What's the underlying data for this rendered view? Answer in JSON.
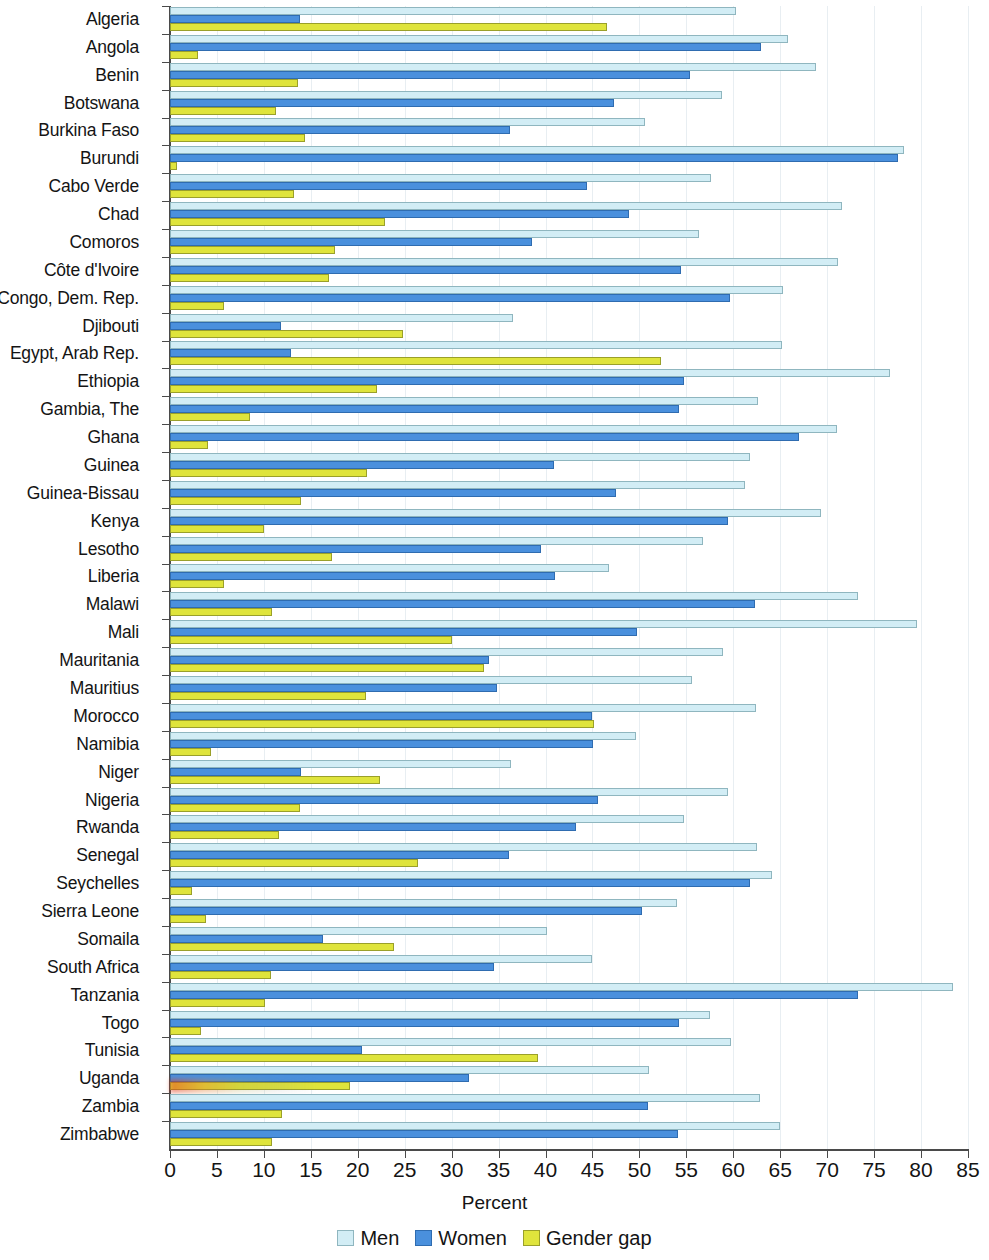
{
  "chart_data": {
    "type": "bar",
    "orientation": "horizontal",
    "title": "",
    "xlabel": "Percent",
    "ylabel": "",
    "xlim": [
      0,
      85
    ],
    "xticks": [
      0,
      5,
      10,
      15,
      20,
      25,
      30,
      35,
      40,
      45,
      50,
      55,
      60,
      65,
      70,
      75,
      80,
      85
    ],
    "grid": true,
    "legend_position": "bottom",
    "colors": {
      "men": "#d2edf5",
      "women": "#4a90dd",
      "gap": "#dfe43c"
    },
    "series": [
      {
        "name": "Men",
        "key": "men"
      },
      {
        "name": "Women",
        "key": "women"
      },
      {
        "name": "Gender gap",
        "key": "gap"
      }
    ],
    "categories": [
      "Algeria",
      "Angola",
      "Benin",
      "Botswana",
      "Burkina Faso",
      "Burundi",
      "Cabo Verde",
      "Chad",
      "Comoros",
      "Côte d'Ivoire",
      "Congo, Dem. Rep.",
      "Djibouti",
      "Egypt, Arab Rep.",
      "Ethiopia",
      "Gambia, The",
      "Ghana",
      "Guinea",
      "Guinea-Bissau",
      "Kenya",
      "Lesotho",
      "Liberia",
      "Malawi",
      "Mali",
      "Mauritania",
      "Mauritius",
      "Morocco",
      "Namibia",
      "Niger",
      "Nigeria",
      "Rwanda",
      "Senegal",
      "Seychelles",
      "Sierra Leone",
      "Somaila",
      "South Africa",
      "Tanzania",
      "Togo",
      "Tunisia",
      "Uganda",
      "Zambia",
      "Zimbabwe"
    ],
    "values": {
      "men": [
        60.3,
        65.8,
        68.8,
        58.8,
        50.6,
        78.2,
        57.6,
        71.6,
        56.3,
        71.2,
        65.3,
        36.5,
        65.2,
        76.7,
        62.6,
        71.0,
        61.8,
        61.3,
        69.3,
        56.8,
        46.8,
        73.3,
        79.6,
        58.9,
        55.6,
        62.4,
        49.6,
        36.3,
        59.4,
        54.8,
        62.5,
        64.1,
        54.0,
        40.2,
        44.9,
        83.4,
        57.5,
        59.8,
        51.0,
        62.8,
        65.0
      ],
      "women": [
        13.9,
        63.0,
        55.4,
        47.3,
        36.2,
        77.5,
        44.4,
        48.9,
        38.6,
        54.4,
        59.6,
        11.8,
        12.9,
        54.7,
        54.2,
        67.0,
        40.9,
        47.5,
        59.4,
        39.5,
        41.0,
        62.3,
        49.7,
        34.0,
        34.8,
        44.9,
        45.1,
        14.0,
        45.6,
        43.2,
        36.1,
        61.8,
        50.3,
        16.3,
        34.5,
        73.3,
        54.2,
        20.5,
        31.8,
        50.9,
        54.1
      ],
      "gap": [
        46.5,
        3.0,
        13.6,
        11.3,
        14.4,
        0.7,
        13.2,
        22.9,
        17.6,
        16.9,
        5.8,
        24.8,
        52.3,
        22.1,
        8.5,
        4.1,
        21.0,
        14.0,
        10.0,
        17.3,
        5.8,
        10.9,
        30.0,
        33.4,
        20.9,
        45.2,
        4.4,
        22.4,
        13.9,
        11.6,
        26.4,
        2.3,
        3.8,
        23.9,
        10.8,
        10.1,
        3.3,
        39.2,
        19.2,
        11.9,
        10.9
      ]
    }
  },
  "axis": {
    "x_title": "Percent",
    "tick_labels": [
      "0",
      "5",
      "10",
      "15",
      "20",
      "25",
      "30",
      "35",
      "40",
      "45",
      "50",
      "55",
      "60",
      "65",
      "70",
      "75",
      "80",
      "85"
    ]
  },
  "legend": {
    "items": [
      {
        "label": "Men",
        "color": "#d2edf5"
      },
      {
        "label": "Women",
        "color": "#4a90dd"
      },
      {
        "label": "Gender gap",
        "color": "#dfe43c"
      }
    ]
  }
}
